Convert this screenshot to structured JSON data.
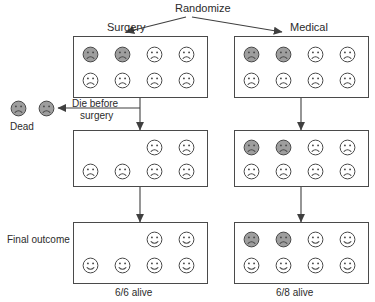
{
  "diagram": {
    "title_label": "Randomize",
    "arm_labels": {
      "left": "Surgery",
      "right": "Medical"
    },
    "side_labels": {
      "dead": "Dead",
      "die_before_surgery": "Die before\nsurgery",
      "die_before_surgery_line1": "Die before",
      "die_before_surgery_line2": "surgery",
      "final_outcome": "Final outcome",
      "surgery_stage": "Surgery"
    },
    "captions": {
      "left": "6/6 alive",
      "right": "6/8 alive"
    },
    "colors": {
      "shaded_face_fill": "#9e9e9e",
      "plain_face_fill": "#ffffff",
      "stroke": "#4a4a4a",
      "text": "#2b2b2b"
    },
    "groups": [
      {
        "id": "surgery-allocated",
        "label": "Surgery",
        "arm": "left",
        "stage": "allocation",
        "total": 8,
        "shaded": 2,
        "plain": 6,
        "faces": [
          {
            "mood": "sad",
            "fill": "shaded"
          },
          {
            "mood": "sad",
            "fill": "shaded"
          },
          {
            "mood": "sad",
            "fill": "plain"
          },
          {
            "mood": "sad",
            "fill": "plain"
          },
          {
            "mood": "sad",
            "fill": "plain"
          },
          {
            "mood": "sad",
            "fill": "plain"
          },
          {
            "mood": "sad",
            "fill": "plain"
          },
          {
            "mood": "sad",
            "fill": "plain"
          }
        ]
      },
      {
        "id": "medical-allocated",
        "label": "Medical",
        "arm": "right",
        "stage": "allocation",
        "total": 8,
        "shaded": 2,
        "plain": 6,
        "faces": [
          {
            "mood": "sad",
            "fill": "shaded"
          },
          {
            "mood": "sad",
            "fill": "shaded"
          },
          {
            "mood": "sad",
            "fill": "plain"
          },
          {
            "mood": "sad",
            "fill": "plain"
          },
          {
            "mood": "sad",
            "fill": "plain"
          },
          {
            "mood": "sad",
            "fill": "plain"
          },
          {
            "mood": "sad",
            "fill": "plain"
          },
          {
            "mood": "sad",
            "fill": "plain"
          }
        ]
      },
      {
        "id": "dead-before-surgery",
        "label": "Dead",
        "arm": "left",
        "stage": "removed",
        "total": 2,
        "shaded": 2,
        "plain": 0,
        "faces": [
          {
            "mood": "sad",
            "fill": "shaded"
          },
          {
            "mood": "sad",
            "fill": "shaded"
          }
        ]
      },
      {
        "id": "surgery-received",
        "label": "Surgery",
        "arm": "left",
        "stage": "treatment",
        "total": 6,
        "shaded": 0,
        "plain": 6,
        "faces": [
          {
            "mood": "sad",
            "fill": "plain"
          },
          {
            "mood": "sad",
            "fill": "plain"
          },
          {
            "mood": "sad",
            "fill": "plain"
          },
          {
            "mood": "sad",
            "fill": "plain"
          },
          {
            "mood": "sad",
            "fill": "plain"
          },
          {
            "mood": "sad",
            "fill": "plain"
          }
        ]
      },
      {
        "id": "medical-treated",
        "label": "",
        "arm": "right",
        "stage": "treatment",
        "total": 8,
        "shaded": 2,
        "plain": 6,
        "faces": [
          {
            "mood": "sad",
            "fill": "shaded"
          },
          {
            "mood": "sad",
            "fill": "shaded"
          },
          {
            "mood": "sad",
            "fill": "plain"
          },
          {
            "mood": "sad",
            "fill": "plain"
          },
          {
            "mood": "sad",
            "fill": "plain"
          },
          {
            "mood": "sad",
            "fill": "plain"
          },
          {
            "mood": "sad",
            "fill": "plain"
          },
          {
            "mood": "sad",
            "fill": "plain"
          }
        ]
      },
      {
        "id": "surgery-outcome",
        "label": "6/6 alive",
        "arm": "left",
        "stage": "outcome",
        "total": 6,
        "shaded": 0,
        "plain": 6,
        "faces": [
          {
            "mood": "happy",
            "fill": "plain"
          },
          {
            "mood": "happy",
            "fill": "plain"
          },
          {
            "mood": "happy",
            "fill": "plain"
          },
          {
            "mood": "happy",
            "fill": "plain"
          },
          {
            "mood": "happy",
            "fill": "plain"
          },
          {
            "mood": "happy",
            "fill": "plain"
          }
        ]
      },
      {
        "id": "medical-outcome",
        "label": "6/8 alive",
        "arm": "right",
        "stage": "outcome",
        "total": 8,
        "shaded": 2,
        "plain": 6,
        "faces": [
          {
            "mood": "sad",
            "fill": "shaded"
          },
          {
            "mood": "sad",
            "fill": "shaded"
          },
          {
            "mood": "happy",
            "fill": "plain"
          },
          {
            "mood": "happy",
            "fill": "plain"
          },
          {
            "mood": "happy",
            "fill": "plain"
          },
          {
            "mood": "happy",
            "fill": "plain"
          },
          {
            "mood": "happy",
            "fill": "plain"
          },
          {
            "mood": "happy",
            "fill": "plain"
          }
        ]
      }
    ]
  }
}
